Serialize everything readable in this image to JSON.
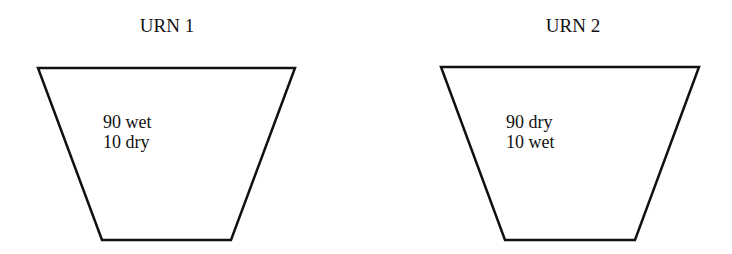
{
  "urns": [
    {
      "title": "URN 1",
      "lines": [
        "90 wet",
        "10 dry"
      ]
    },
    {
      "title": "URN 2",
      "lines": [
        "90 dry",
        "10 wet"
      ]
    }
  ]
}
